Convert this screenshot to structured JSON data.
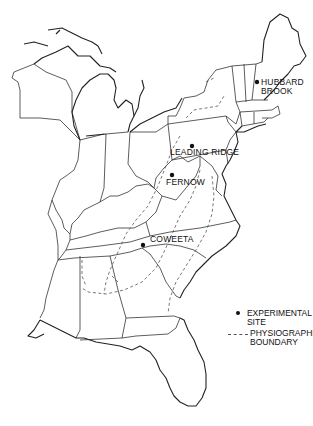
{
  "map": {
    "region": "Eastern United States",
    "sites": [
      {
        "name": "HUBBARD",
        "name2": "BROOK",
        "x": 257,
        "y": 82
      },
      {
        "name": "LEADING RIDGE",
        "x": 192,
        "y": 146
      },
      {
        "name": "FERNOW",
        "x": 172,
        "y": 175
      },
      {
        "name": "COWEETA",
        "x": 143,
        "y": 245
      }
    ]
  },
  "legend": {
    "items": [
      {
        "symbol": "dot",
        "label": "EXPERIMENTAL SITE"
      },
      {
        "symbol": "dashed-line",
        "label": "PHYSIOGRAPHIC",
        "label2": "BOUNDARY"
      }
    ]
  }
}
